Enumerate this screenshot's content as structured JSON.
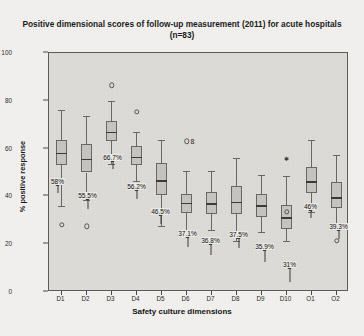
{
  "chart_data": {
    "type": "box",
    "title": "Positive dimensional scores of follow-up measurement (2011) for acute hospitals (n=83)",
    "xlabel": "Safety culture dimensions",
    "ylabel": "% positive response",
    "ylim": [
      0,
      100
    ],
    "yticks": [
      0,
      20,
      40,
      60,
      80,
      100
    ],
    "ytick_labels": [
      "0",
      "20",
      "40",
      "60",
      "80",
      "100"
    ],
    "grid": false,
    "legend": "none",
    "categories": [
      "D1",
      "D2",
      "D3",
      "D4",
      "D5",
      "D6",
      "D7",
      "D8",
      "D9",
      "D10",
      "O1",
      "O2"
    ],
    "median_labels": [
      "58%",
      "55.5%",
      "66.7%",
      "56.2%",
      "46.5%",
      "37.1%",
      "36.8%",
      "37.5%",
      "35.9%",
      "31%",
      "46%",
      "39.3%"
    ],
    "boxes": [
      {
        "category": "D1",
        "min": 36.0,
        "q1": 53.0,
        "median": 58.0,
        "q3": 63.5,
        "max": 76.0,
        "outliers": [
          28.0
        ],
        "outlier_ids": [],
        "stars": []
      },
      {
        "category": "D2",
        "min": 38.5,
        "q1": 50.0,
        "median": 55.5,
        "q3": 62.0,
        "max": 73.5,
        "outliers": [
          27.5
        ],
        "outlier_ids": [],
        "stars": []
      },
      {
        "category": "D3",
        "min": 53.5,
        "q1": 63.0,
        "median": 66.7,
        "q3": 71.5,
        "max": 80.0,
        "outliers": [
          86.5
        ],
        "outlier_ids": [],
        "stars": []
      },
      {
        "category": "D4",
        "min": 46.5,
        "q1": 53.0,
        "median": 56.2,
        "q3": 61.0,
        "max": 67.0,
        "outliers": [
          75.5
        ],
        "outlier_ids": [],
        "stars": []
      },
      {
        "category": "D5",
        "min": 27.5,
        "q1": 40.5,
        "median": 46.5,
        "q3": 54.0,
        "max": 63.5,
        "outliers": [],
        "outlier_ids": [],
        "stars": []
      },
      {
        "category": "D6",
        "min": 24.5,
        "q1": 33.0,
        "median": 37.1,
        "q3": 41.0,
        "max": 50.5,
        "outliers": [
          63.0
        ],
        "outlier_ids": [
          "8"
        ],
        "stars": []
      },
      {
        "category": "D7",
        "min": 26.0,
        "q1": 32.5,
        "median": 36.8,
        "q3": 42.0,
        "max": 50.5,
        "outliers": [],
        "outlier_ids": [],
        "stars": []
      },
      {
        "category": "D8",
        "min": 21.5,
        "q1": 32.5,
        "median": 37.5,
        "q3": 44.5,
        "max": 56.0,
        "outliers": [],
        "outlier_ids": [],
        "stars": []
      },
      {
        "category": "D9",
        "min": 25.0,
        "q1": 31.5,
        "median": 35.9,
        "q3": 41.0,
        "max": 49.0,
        "outliers": [],
        "outlier_ids": [],
        "stars": []
      },
      {
        "category": "D10",
        "min": 21.5,
        "q1": 26.5,
        "median": 31.0,
        "q3": 36.5,
        "max": 48.5,
        "outliers": [
          33.5
        ],
        "outlier_ids": [],
        "stars": [
          55.5
        ]
      },
      {
        "category": "O1",
        "min": 33.5,
        "q1": 41.5,
        "median": 46.0,
        "q3": 52.5,
        "max": 63.5,
        "outliers": [],
        "outlier_ids": [],
        "stars": []
      },
      {
        "category": "O2",
        "min": 27.5,
        "q1": 35.0,
        "median": 39.3,
        "q3": 46.0,
        "max": 57.5,
        "outliers": [
          21.5
        ],
        "outlier_ids": [],
        "stars": []
      }
    ]
  }
}
